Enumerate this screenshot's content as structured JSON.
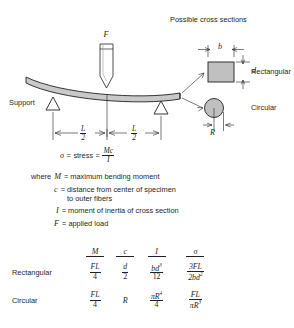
{
  "figure": {
    "title_cross_sections": "Possible cross sections",
    "load_symbol": "F",
    "support_label": "Support",
    "rect_label": "Rectangular",
    "circ_label": "Circular",
    "dim_b": "b",
    "dim_d": "d",
    "dim_R": "R",
    "span_left": {
      "num": "L",
      "den": "2"
    },
    "span_right": {
      "num": "L",
      "den": "2"
    },
    "colors": {
      "specimen_fill": "#c9c9c9",
      "section_fill": "#c0c0c0",
      "line": "#231f20",
      "background": "#ffffff"
    }
  },
  "equation": {
    "sigma_symbol": "σ",
    "equals": "=",
    "stress_word": "stress",
    "mc_over_i": {
      "num": "Mc",
      "den": "I"
    }
  },
  "definitions": {
    "where_word": "where",
    "items": [
      {
        "symbol": "M",
        "text": "= maximum bending moment"
      },
      {
        "symbol": "c",
        "text": "= distance from center of specimen",
        "text2": "to outer fibers"
      },
      {
        "symbol": "I",
        "text": "= moment of inertia of cross section"
      },
      {
        "symbol": "F",
        "text": "= applied load"
      }
    ]
  },
  "table": {
    "headers": [
      "M",
      "c",
      "I",
      "σ"
    ],
    "rows": [
      {
        "label": "Rectangular",
        "M": {
          "num": "FL",
          "den": "4"
        },
        "c": {
          "num": "d",
          "den": "2"
        },
        "I": {
          "num": "bd",
          "num_exp": "3",
          "den": "12"
        },
        "sigma": {
          "num": "3FL",
          "den": "2bd",
          "den_exp": "2"
        }
      },
      {
        "label": "Circular",
        "M": {
          "num": "FL",
          "den": "4"
        },
        "c": {
          "plain": "R"
        },
        "I": {
          "num": "πR",
          "num_exp": "4",
          "den": "4"
        },
        "sigma": {
          "num": "FL",
          "den": "πR",
          "den_exp": "3"
        }
      }
    ]
  }
}
